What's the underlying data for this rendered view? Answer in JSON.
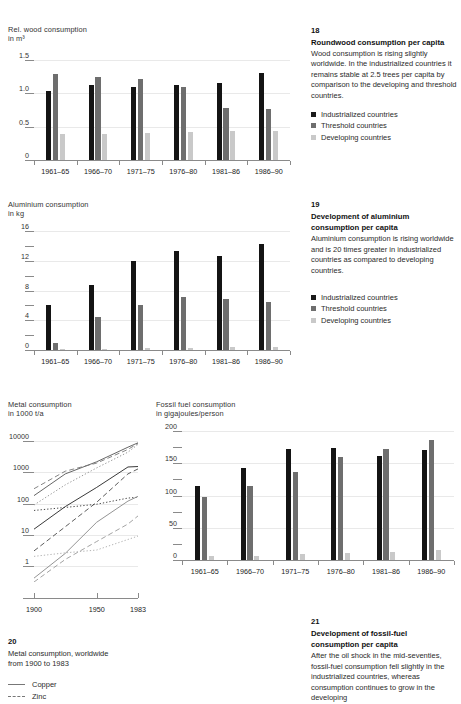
{
  "charts": [
    {
      "id": "wood",
      "axis_title_line1": "Rel. wood consumption",
      "axis_title_line2": "in m³",
      "chart_data": {
        "type": "bar",
        "title": "Rel. wood consumption",
        "ylabel": "in m³",
        "xlabel": "",
        "ylim": [
          0,
          1.5
        ],
        "yticks": [
          0,
          0.5,
          1.0,
          1.5
        ],
        "ytick_labels": [
          "0",
          "0.5",
          "1.0",
          "1.5"
        ],
        "grid": true,
        "legend_position": "right-panel",
        "categories": [
          "1961–65",
          "1966–70",
          "1971–75",
          "1976–80",
          "1981–86",
          "1986–90"
        ],
        "series": [
          {
            "name": "Industrialized countries",
            "color": "#141414",
            "values": [
              1.04,
              1.12,
              1.1,
              1.13,
              1.16,
              1.3
            ]
          },
          {
            "name": "Threshold countries",
            "color": "#6e6e6e",
            "values": [
              1.29,
              1.24,
              1.21,
              1.09,
              0.78,
              0.76
            ]
          },
          {
            "name": "Developing countries",
            "color": "#c9c9c9",
            "values": [
              0.39,
              0.39,
              0.41,
              0.42,
              0.43,
              0.44
            ]
          }
        ]
      },
      "note": {
        "number": "18",
        "title": "Roundwood consumption per capita",
        "body": "Wood consumption is rising slightly worldwide. In the industrialized countries it remains stable at 2.5 trees per capita by comparison to the developing and threshold countries.",
        "legend": [
          "Industrialized countries",
          "Threshold countries",
          "Developing countries"
        ]
      }
    },
    {
      "id": "aluminium",
      "axis_title_line1": "Aluminium consumption",
      "axis_title_line2": "in kg",
      "chart_data": {
        "type": "bar",
        "title": "Aluminium consumption",
        "ylabel": "in kg",
        "xlabel": "",
        "ylim": [
          0,
          16
        ],
        "yticks": [
          0,
          2,
          4,
          6,
          8,
          10,
          12,
          14,
          16
        ],
        "ytick_labels": [
          "0",
          "",
          "4",
          "",
          "8",
          "",
          "12",
          "",
          "16"
        ],
        "grid": true,
        "legend_position": "right-panel",
        "categories": [
          "1961–65",
          "1966–70",
          "1971–75",
          "1976–80",
          "1981–86",
          "1986–90"
        ],
        "series": [
          {
            "name": "Industrialized countries",
            "color": "#141414",
            "values": [
              6.0,
              8.8,
              12.0,
              13.3,
              12.7,
              14.3
            ]
          },
          {
            "name": "Threshold countries",
            "color": "#6e6e6e",
            "values": [
              1.0,
              4.4,
              6.0,
              7.1,
              6.8,
              6.4
            ]
          },
          {
            "name": "Developing countries",
            "color": "#c9c9c9",
            "values": [
              0.12,
              0.15,
              0.25,
              0.3,
              0.38,
              0.45
            ]
          }
        ]
      },
      "note": {
        "number": "19",
        "title_line1": "Development of aluminium",
        "title_line2": "consumption per capita",
        "body": "Aluminium consumption is rising worldwide and is 20 times greater in industrialized countries as compared to developing countries.",
        "legend": [
          "Industrialized countries",
          "Threshold countries",
          "Developing countries"
        ]
      }
    },
    {
      "id": "metal",
      "axis_title_line1": "Metal consumption",
      "axis_title_line2": "in 1000 t/a",
      "chart_data": {
        "type": "line",
        "title": "Metal consumption",
        "ylabel": "in 1000 t/a",
        "xlabel": "",
        "yscale": "log",
        "ylim": [
          0.3,
          20000
        ],
        "yticks": [
          1,
          10,
          100,
          1000,
          10000
        ],
        "ytick_labels": [
          "1",
          "10",
          "100",
          "1000",
          "10000"
        ],
        "xticks": [
          1900,
          1950,
          1983
        ],
        "xtick_labels": [
          "1900",
          "1950",
          "1983"
        ],
        "grid": true,
        "x": [
          1900,
          1925,
          1950,
          1975,
          1983
        ],
        "series": [
          {
            "name": "Copper",
            "style": "solid",
            "color": "#555555",
            "values": [
              180,
              900,
              2200,
              6500,
              9000
            ]
          },
          {
            "name": "Zinc",
            "style": "dashed",
            "color": "#777777",
            "values": [
              300,
              1100,
              2000,
              5500,
              8600
            ]
          },
          {
            "name": "Lead",
            "style": "dotted",
            "color": "#8a8a8a",
            "values": [
              90,
              400,
              1400,
              4500,
              8000
            ]
          },
          {
            "name": "Tin",
            "style": "solid",
            "color": "#222222",
            "values": [
              15,
              80,
              330,
              1500,
              1550
            ]
          },
          {
            "name": "Nickel",
            "style": "dotted",
            "color": "#333333",
            "values": [
              60,
              75,
              95,
              150,
              160
            ]
          },
          {
            "name": "Aluminium",
            "style": "dashed",
            "color": "#4a4a4a",
            "values": [
              3,
              18,
              110,
              900,
              1300
            ]
          },
          {
            "name": "Chromium",
            "style": "solid",
            "color": "#888888",
            "values": [
              0.4,
              2.5,
              25,
              120,
              170
            ]
          },
          {
            "name": "Magnesium",
            "style": "dashed",
            "color": "#999999",
            "values": [
              0.3,
              1.6,
              6,
              22,
              40
            ]
          },
          {
            "name": "Titanium",
            "style": "dotted",
            "color": "#aaaaaa",
            "values": [
              2.0,
              2.6,
              3.2,
              7,
              9
            ]
          }
        ]
      },
      "note": {
        "number": "20",
        "body_line1": "Metal consumption, worldwide",
        "body_line2": "from 1900 to 1983",
        "legend": [
          "Copper",
          "Zinc"
        ]
      }
    },
    {
      "id": "fossil",
      "axis_title_line1": "Fossil fuel consumption",
      "axis_title_line2": "in gigajoules/person",
      "chart_data": {
        "type": "bar",
        "title": "Fossil fuel consumption",
        "ylabel": "in gigajoules/person",
        "xlabel": "",
        "ylim": [
          0,
          200
        ],
        "yticks": [
          0,
          25,
          50,
          75,
          100,
          125,
          150,
          175,
          200
        ],
        "ytick_labels": [
          "0",
          "",
          "50",
          "",
          "100",
          "",
          "150",
          "",
          "200"
        ],
        "grid": true,
        "legend_position": "right-panel",
        "categories": [
          "1961–65",
          "1966–70",
          "1971–75",
          "1976–80",
          "1981–86",
          "1986–90"
        ],
        "series": [
          {
            "name": "Industrialized countries",
            "color": "#141414",
            "values": [
              115,
              143,
              172,
              174,
              162,
              170
            ]
          },
          {
            "name": "Threshold countries",
            "color": "#6e6e6e",
            "values": [
              98,
              115,
              137,
              160,
              172,
              186
            ]
          },
          {
            "name": "Developing countries",
            "color": "#c9c9c9",
            "values": [
              6,
              7,
              9,
              11,
              13,
              16
            ]
          }
        ]
      },
      "note": {
        "number": "21",
        "title_line1": "Development of fossil-fuel",
        "title_line2": "consumption per capita",
        "body": "After the oil shock in the mid-seventies, fossil-fuel consumption fell slightly in the industrialized countries, whereas consumption continues to grow in the developing"
      }
    }
  ]
}
